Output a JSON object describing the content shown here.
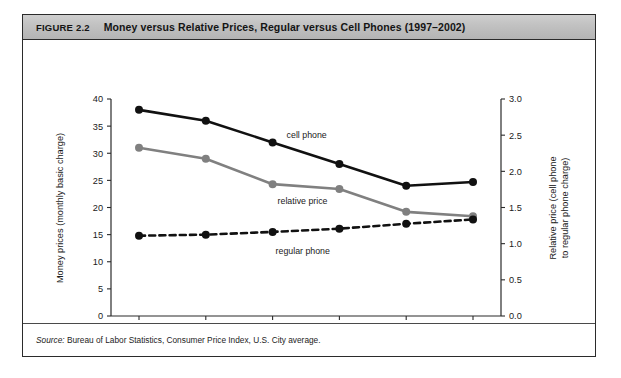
{
  "figure": {
    "label": "FIGURE 2.2",
    "heading": "Money versus Relative Prices, Regular versus Cell Phones (1997–2002)",
    "source_prefix": "Source:",
    "source_text": " Bureau of Labor Statistics, Consumer Price Index, U.S. City average."
  },
  "chart_data": {
    "type": "line",
    "title": "Money versus Relative Prices, Regular versus Cell Phones (1997–2002)",
    "x": [
      "1997",
      "1998",
      "1999",
      "2000",
      "2001",
      "2002"
    ],
    "categories": [
      "1997",
      "1998",
      "1999",
      "2000",
      "2001",
      "2002"
    ],
    "xlabel": "Year",
    "ylabel": "Money prices (monthly basic charge)",
    "ylabel_right": "Relative price (cell phone to regular phone charge)",
    "ylim": [
      0,
      40
    ],
    "ylim_right": [
      0.0,
      3.0
    ],
    "yticks": [
      0,
      5,
      10,
      15,
      20,
      25,
      30,
      35,
      40
    ],
    "ytick_labels": [
      "0",
      "5",
      "10",
      "15",
      "20",
      "25",
      "30",
      "35",
      "40"
    ],
    "yticks_right": [
      0.0,
      0.5,
      1.0,
      1.5,
      2.0,
      2.5,
      3.0
    ],
    "ytick_labels_right": [
      "0.0",
      "0.5",
      "1.0",
      "1.5",
      "2.0",
      "2.5",
      "3.0"
    ],
    "grid": false,
    "legend_position": "inline-annotations",
    "series": [
      {
        "name": "cell phone",
        "axis": "left",
        "color": "#111111",
        "style": "solid",
        "marker": "circle",
        "values": [
          38.0,
          36.0,
          32.0,
          28.0,
          24.0,
          24.7
        ],
        "annotation": "cell phone"
      },
      {
        "name": "relative price",
        "axis": "right",
        "color": "#808080",
        "style": "solid",
        "marker": "circle",
        "values": [
          31.0,
          29.0,
          24.3,
          23.4,
          19.2,
          18.4
        ],
        "values_right_axis": [
          2.33,
          2.18,
          1.82,
          1.76,
          1.44,
          1.38
        ],
        "annotation": "relative price"
      },
      {
        "name": "regular phone",
        "axis": "left",
        "color": "#111111",
        "style": "dashed",
        "marker": "circle",
        "values": [
          14.8,
          15.0,
          15.5,
          16.1,
          17.0,
          17.8
        ],
        "annotation": "regular phone"
      }
    ]
  }
}
